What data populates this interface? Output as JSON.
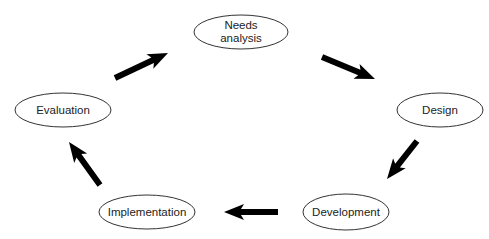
{
  "diagram": {
    "type": "cycle",
    "nodes": [
      {
        "id": "needs",
        "label": "Needs\nanalysis",
        "cx": 241,
        "cy": 32,
        "rx": 47,
        "ry": 17
      },
      {
        "id": "design",
        "label": "Design",
        "cx": 440,
        "cy": 110,
        "rx": 43,
        "ry": 17
      },
      {
        "id": "development",
        "label": "Development",
        "cx": 346,
        "cy": 212,
        "rx": 43,
        "ry": 18
      },
      {
        "id": "implementation",
        "label": "Implementation",
        "cx": 147,
        "cy": 212,
        "rx": 48,
        "ry": 17
      },
      {
        "id": "evaluation",
        "label": "Evaluation",
        "cx": 63,
        "cy": 110,
        "rx": 48,
        "ry": 17
      }
    ],
    "edges": [
      {
        "from": "evaluation",
        "to": "needs",
        "x1": 115,
        "y1": 78,
        "x2": 168,
        "y2": 53
      },
      {
        "from": "needs",
        "to": "design",
        "x1": 322,
        "y1": 57,
        "x2": 375,
        "y2": 79
      },
      {
        "from": "design",
        "to": "development",
        "x1": 417,
        "y1": 141,
        "x2": 387,
        "y2": 179
      },
      {
        "from": "development",
        "to": "implementation",
        "x1": 278,
        "y1": 212,
        "x2": 224,
        "y2": 212
      },
      {
        "from": "implementation",
        "to": "evaluation",
        "x1": 100,
        "y1": 185,
        "x2": 69,
        "y2": 142
      }
    ],
    "colors": {
      "stroke": "#333333",
      "arrow": "#000000",
      "text": "#222222",
      "background": "#ffffff"
    }
  }
}
